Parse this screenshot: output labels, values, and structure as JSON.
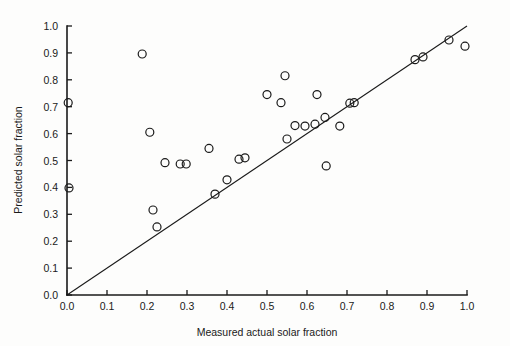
{
  "chart_data": {
    "type": "scatter",
    "title": "",
    "xlabel": "Measured actual solar fraction",
    "ylabel": "Predicted solar fraction",
    "xlim": [
      0.0,
      1.0
    ],
    "ylim": [
      0.0,
      1.0
    ],
    "grid": false,
    "legend": null,
    "xticks": [
      "0.0",
      "0.1",
      "0.2",
      "0.3",
      "0.4",
      "0.5",
      "0.6",
      "0.7",
      "0.8",
      "0.9",
      "1.0"
    ],
    "xtick_values": [
      0.0,
      0.1,
      0.2,
      0.3,
      0.4,
      0.5,
      0.6,
      0.7,
      0.8,
      0.9,
      1.0
    ],
    "yticks": [
      "0.0",
      "0.1",
      "0.2",
      "0.3",
      "0.4",
      "0.5",
      "0.6",
      "0.7",
      "0.8",
      "0.9",
      "1.0"
    ],
    "ytick_values": [
      0.0,
      0.1,
      0.2,
      0.3,
      0.4,
      0.5,
      0.6,
      0.7,
      0.8,
      0.9,
      1.0
    ],
    "marker": "open-circle",
    "marker_radius": 4.0,
    "reference_line": {
      "name": "one-to-one-line",
      "x": [
        0.0,
        1.0
      ],
      "y": [
        0.0,
        1.0
      ],
      "style": "solid"
    },
    "points": [
      {
        "x": 0.003,
        "y": 0.715
      },
      {
        "x": 0.005,
        "y": 0.398
      },
      {
        "x": 0.188,
        "y": 0.896
      },
      {
        "x": 0.207,
        "y": 0.605
      },
      {
        "x": 0.215,
        "y": 0.316
      },
      {
        "x": 0.225,
        "y": 0.253
      },
      {
        "x": 0.245,
        "y": 0.492
      },
      {
        "x": 0.283,
        "y": 0.487
      },
      {
        "x": 0.298,
        "y": 0.487
      },
      {
        "x": 0.355,
        "y": 0.545
      },
      {
        "x": 0.37,
        "y": 0.375
      },
      {
        "x": 0.4,
        "y": 0.428
      },
      {
        "x": 0.43,
        "y": 0.505
      },
      {
        "x": 0.445,
        "y": 0.51
      },
      {
        "x": 0.5,
        "y": 0.745
      },
      {
        "x": 0.535,
        "y": 0.715
      },
      {
        "x": 0.545,
        "y": 0.815
      },
      {
        "x": 0.55,
        "y": 0.58
      },
      {
        "x": 0.57,
        "y": 0.63
      },
      {
        "x": 0.595,
        "y": 0.628
      },
      {
        "x": 0.62,
        "y": 0.635
      },
      {
        "x": 0.625,
        "y": 0.745
      },
      {
        "x": 0.645,
        "y": 0.66
      },
      {
        "x": 0.648,
        "y": 0.48
      },
      {
        "x": 0.682,
        "y": 0.628
      },
      {
        "x": 0.707,
        "y": 0.713
      },
      {
        "x": 0.718,
        "y": 0.715
      },
      {
        "x": 0.87,
        "y": 0.875
      },
      {
        "x": 0.89,
        "y": 0.885
      },
      {
        "x": 0.955,
        "y": 0.948
      },
      {
        "x": 0.995,
        "y": 0.925
      }
    ]
  },
  "axes": {
    "x_title": "Measured actual solar fraction",
    "y_title": "Predicted solar fraction"
  }
}
